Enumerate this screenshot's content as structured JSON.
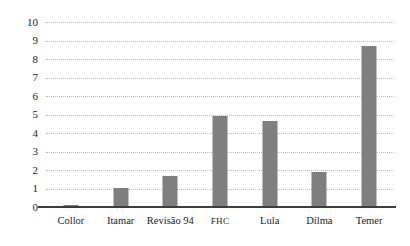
{
  "chart_data": {
    "type": "bar",
    "title": "",
    "subtitle": "",
    "xlabel": "",
    "ylabel": "",
    "categories": [
      "Collor",
      "Itamar",
      "Revisão 94",
      "FHC",
      "Lula",
      "Dilma",
      "Temer"
    ],
    "values": [
      0.1,
      1.05,
      1.7,
      4.9,
      4.65,
      1.9,
      8.7
    ],
    "series": [
      {
        "name": "",
        "values": [
          0.1,
          1.05,
          1.7,
          4.9,
          4.65,
          1.9,
          8.7
        ]
      }
    ],
    "ylim": [
      0,
      10
    ],
    "ytick_step": 1,
    "yticks": [
      "10",
      "9",
      "8",
      "7",
      "6",
      "5",
      "4",
      "3",
      "2",
      "1",
      "0"
    ],
    "grid": true,
    "grid_axis": "y",
    "grid_style": "dotted",
    "legend": false,
    "legend_position": "none",
    "bar_color": "#7f7f7f",
    "grid_color": "#b9b9b9",
    "axis_color": "#3d3d3d",
    "background_color": "#ffffff",
    "text_color": "#1d1d1d"
  }
}
